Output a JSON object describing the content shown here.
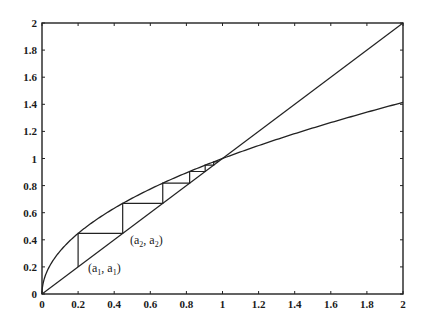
{
  "chart_data": {
    "type": "line",
    "title": "",
    "xlabel": "",
    "ylabel": "",
    "xlim": [
      0,
      2
    ],
    "ylim": [
      0,
      2
    ],
    "grid": false,
    "legend": null,
    "x_ticks": [
      "0",
      "0.2",
      "0.4",
      "0.6",
      "0.8",
      "1",
      "1.2",
      "1.4",
      "1.6",
      "1.8",
      "2"
    ],
    "y_ticks": [
      "0",
      "0.2",
      "0.4",
      "0.6",
      "0.8",
      "1",
      "1.2",
      "1.4",
      "1.6",
      "1.8",
      "2"
    ],
    "series": [
      {
        "name": "y = x (identity line)",
        "x": [
          0,
          2
        ],
        "y": [
          0,
          2
        ]
      },
      {
        "name": "y = f(x) (square-root curve)",
        "x": [
          0,
          0.05,
          0.2,
          0.45,
          0.7,
          1,
          1.5,
          2
        ],
        "y": [
          0,
          0.224,
          0.447,
          0.671,
          0.837,
          1,
          1.225,
          1.414
        ]
      },
      {
        "name": "cobweb iterates",
        "x": [
          0.2,
          0.447,
          0.669,
          0.818,
          0.904,
          0.951,
          0.975
        ],
        "y": [
          0.2,
          0.447,
          0.669,
          0.818,
          0.904,
          0.951,
          0.975
        ]
      }
    ],
    "annotations": [
      {
        "text": "(a1, a1)",
        "x": 0.2,
        "y": 0.2
      },
      {
        "text": "(a2, a2)",
        "x": 0.447,
        "y": 0.447
      }
    ]
  },
  "labels": {
    "a1": {
      "open": "(a",
      "sub1": "1",
      "mid": ", a",
      "sub2": "1",
      "close": ")"
    },
    "a2": {
      "open": "(a",
      "sub1": "2",
      "mid": ", a",
      "sub2": "2",
      "close": ")"
    }
  }
}
